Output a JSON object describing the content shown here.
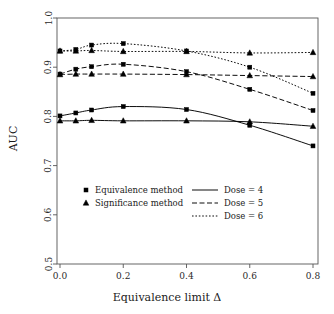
{
  "chart_data": {
    "type": "line",
    "title": "",
    "xlabel": "Equivalence limit Δ",
    "ylabel": "AUC",
    "xlim": [
      0.0,
      0.8
    ],
    "ylim": [
      0.5,
      1.0
    ],
    "xticks": [
      "0.0",
      "0.2",
      "0.4",
      "0.6",
      "0.8"
    ],
    "xtick_values": [
      0.0,
      0.2,
      0.4,
      0.6,
      0.8
    ],
    "yticks": [
      "0.5",
      "0.6",
      "0.7",
      "0.8",
      "0.9",
      "1.0"
    ],
    "ytick_values": [
      0.5,
      0.6,
      0.7,
      0.8,
      0.9,
      1.0
    ],
    "grid": false,
    "x": [
      0.0,
      0.05,
      0.1,
      0.2,
      0.4,
      0.6,
      0.8
    ],
    "series": [
      {
        "name": "Dose = 6, Equivalence method",
        "dose": 6,
        "method": "Equivalence method",
        "marker": "square",
        "linestyle": "dotted",
        "color": "#000000",
        "values": [
          0.933,
          0.936,
          0.945,
          0.948,
          0.933,
          0.9,
          0.847
        ]
      },
      {
        "name": "Dose = 6, Significance method",
        "dose": 6,
        "method": "Significance method",
        "marker": "triangle",
        "linestyle": "dotted",
        "color": "#000000",
        "values": [
          0.933,
          0.933,
          0.934,
          0.932,
          0.932,
          0.929,
          0.93
        ]
      },
      {
        "name": "Dose = 5, Equivalence method",
        "dose": 5,
        "method": "Equivalence method",
        "marker": "square",
        "linestyle": "dashed",
        "color": "#000000",
        "values": [
          0.886,
          0.896,
          0.901,
          0.906,
          0.891,
          0.855,
          0.812
        ]
      },
      {
        "name": "Dose = 5, Significance method",
        "dose": 5,
        "method": "Significance method",
        "marker": "triangle",
        "linestyle": "dashed",
        "color": "#000000",
        "values": [
          0.885,
          0.886,
          0.886,
          0.886,
          0.885,
          0.883,
          0.881
        ]
      },
      {
        "name": "Dose = 4, Equivalence method",
        "dose": 4,
        "method": "Equivalence method",
        "marker": "square",
        "linestyle": "solid",
        "color": "#000000",
        "values": [
          0.801,
          0.807,
          0.813,
          0.82,
          0.814,
          0.782,
          0.74
        ]
      },
      {
        "name": "Dose = 4, Significance method",
        "dose": 4,
        "method": "Significance method",
        "marker": "triangle",
        "linestyle": "solid",
        "color": "#000000",
        "values": [
          0.791,
          0.791,
          0.792,
          0.791,
          0.791,
          0.789,
          0.78
        ]
      }
    ],
    "legend": {
      "position": "center-lower",
      "marker_entries": [
        {
          "label": "Equivalence method",
          "marker": "square"
        },
        {
          "label": "Significance method",
          "marker": "triangle"
        }
      ],
      "line_entries": [
        {
          "label": "Dose = 4",
          "linestyle": "solid"
        },
        {
          "label": "Dose = 5",
          "linestyle": "dashed"
        },
        {
          "label": "Dose = 6",
          "linestyle": "dotted"
        }
      ]
    }
  }
}
